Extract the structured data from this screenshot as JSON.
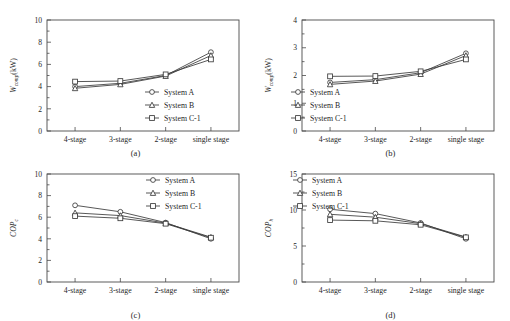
{
  "figure": {
    "panels": [
      "a",
      "b",
      "c",
      "d"
    ],
    "categories": [
      "4-stage",
      "3-stage",
      "2-stage",
      "single stage"
    ],
    "legend_labels": [
      "System A",
      "System B",
      "System C-1"
    ],
    "marker_shapes": [
      "circle",
      "triangle",
      "square"
    ],
    "line_color": "#3a3a3a"
  },
  "captions": {
    "a": "(a)",
    "b": "(b)",
    "c": "(c)",
    "d": "(d)"
  },
  "chart_data": [
    {
      "type": "line",
      "panel": "(a)",
      "title": "",
      "xlabel": "",
      "ylabel": "W",
      "ylabel_sub": "comp",
      "ylabel_unit": "(kW)",
      "categories": [
        "4-stage",
        "3-stage",
        "2-stage",
        "single stage"
      ],
      "yticks": [
        0,
        2,
        4,
        6,
        8,
        10
      ],
      "ylim": [
        0,
        10
      ],
      "grid": false,
      "legend_position": "lower right",
      "series": [
        {
          "name": "System A",
          "marker": "circle",
          "values": [
            4.0,
            4.3,
            5.0,
            7.1
          ]
        },
        {
          "name": "System B",
          "marker": "triangle",
          "values": [
            3.85,
            4.2,
            4.95,
            6.8
          ]
        },
        {
          "name": "System C-1",
          "marker": "square",
          "values": [
            4.45,
            4.5,
            5.1,
            6.45
          ]
        }
      ]
    },
    {
      "type": "line",
      "panel": "(b)",
      "title": "",
      "xlabel": "",
      "ylabel": "W",
      "ylabel_sub": "comp",
      "ylabel_unit": "(kW)",
      "categories": [
        "4-stage",
        "3-stage",
        "2-stage",
        "single stage"
      ],
      "yticks": [
        0,
        1,
        2,
        3,
        4
      ],
      "ylim": [
        0,
        4
      ],
      "grid": false,
      "legend_position": "lower left",
      "series": [
        {
          "name": "System A",
          "marker": "circle",
          "values": [
            1.75,
            1.85,
            2.1,
            2.8
          ]
        },
        {
          "name": "System B",
          "marker": "triangle",
          "values": [
            1.68,
            1.8,
            2.05,
            2.72
          ]
        },
        {
          "name": "System C-1",
          "marker": "square",
          "values": [
            1.97,
            1.98,
            2.15,
            2.58
          ]
        }
      ]
    },
    {
      "type": "line",
      "panel": "(c)",
      "title": "",
      "xlabel": "",
      "ylabel": "COP",
      "ylabel_sub": "c",
      "ylabel_unit": "",
      "categories": [
        "4-stage",
        "3-stage",
        "2-stage",
        "single stage"
      ],
      "yticks": [
        0,
        2,
        4,
        6,
        8,
        10
      ],
      "ylim": [
        0,
        10
      ],
      "grid": false,
      "legend_position": "upper right",
      "series": [
        {
          "name": "System A",
          "marker": "circle",
          "values": [
            7.1,
            6.5,
            5.5,
            4.0
          ]
        },
        {
          "name": "System B",
          "marker": "triangle",
          "values": [
            6.4,
            6.15,
            5.45,
            4.15
          ]
        },
        {
          "name": "System C-1",
          "marker": "square",
          "values": [
            6.1,
            5.9,
            5.4,
            4.1
          ]
        }
      ]
    },
    {
      "type": "line",
      "panel": "(d)",
      "title": "",
      "xlabel": "",
      "ylabel": "COP",
      "ylabel_sub": "h",
      "ylabel_unit": "",
      "categories": [
        "4-stage",
        "3-stage",
        "2-stage",
        "single stage"
      ],
      "yticks": [
        0,
        5,
        10,
        15
      ],
      "ylim": [
        0,
        15
      ],
      "grid": false,
      "legend_position": "upper left",
      "series": [
        {
          "name": "System A",
          "marker": "circle",
          "values": [
            10.1,
            9.5,
            8.2,
            6.0
          ]
        },
        {
          "name": "System B",
          "marker": "triangle",
          "values": [
            9.4,
            9.0,
            8.1,
            6.25
          ]
        },
        {
          "name": "System C-1",
          "marker": "square",
          "values": [
            8.6,
            8.5,
            7.95,
            6.2
          ]
        }
      ]
    }
  ]
}
